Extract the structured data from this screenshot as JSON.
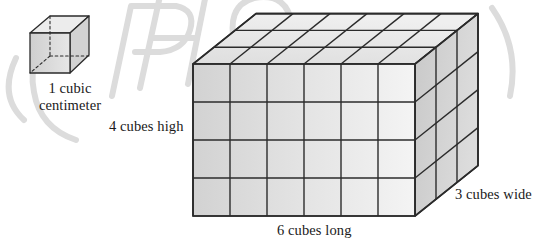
{
  "figure": {
    "name": "volume-of-rectangular-prism-in-unit-cubes",
    "background_color": "#ffffff",
    "ink_color": "#1a1a1a"
  },
  "unit_cube": {
    "label_line_1": "1 cubic",
    "label_line_2": "centimeter",
    "hidden_edges_style": "dashed",
    "face_fill": "#d6d6d6",
    "top_fill": "#ededed"
  },
  "prism": {
    "length_label": "6 cubes long",
    "height_label": "4 cubes high",
    "width_label": "3 cubes wide",
    "cubes_long": 6,
    "cubes_high": 4,
    "cubes_wide": 3,
    "front_face_fill": "#d9d9d9",
    "top_face_fill": "#e9e9e9",
    "side_face_fill": "#cfcfcf",
    "edge_color": "#2b2b2b"
  },
  "watermark": {
    "color": "#d9d9d9",
    "text": "PHOTO"
  }
}
